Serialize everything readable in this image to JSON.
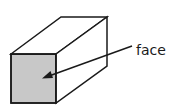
{
  "diagram": {
    "shape": "rectangular-prism",
    "label": "face",
    "colors": {
      "stroke": "#1a1a1a",
      "face_fill": "#c8c8c8",
      "background": "#ffffff"
    }
  }
}
